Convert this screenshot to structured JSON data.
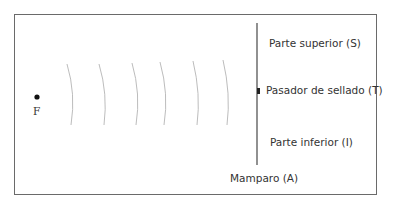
{
  "diagram": {
    "source_label": "F",
    "wavefront_count": 6,
    "wall_label": "Mamparo (A)",
    "labels": {
      "top": "Parte superior (S)",
      "pin": "Pasador de sellado (T)",
      "bottom": "Parte inferior (I)"
    },
    "colors": {
      "frame": "#6a6a6a",
      "wall": "#555555",
      "waves": "#b0b0b0",
      "text": "#333333"
    }
  }
}
